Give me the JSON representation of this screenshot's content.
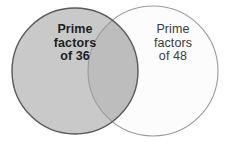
{
  "figure": {
    "type": "venn-diagram",
    "width": 230,
    "height": 147,
    "background_color": "#ffffff"
  },
  "sets": {
    "left": {
      "name": "prime-factors-of-36",
      "lines": [
        "Prime",
        "factors",
        "of 36"
      ],
      "line1": "Prime",
      "line2": "factors",
      "line3": "of 36",
      "fill_color": "#c9c9c9",
      "stroke_color": "#5a5a5a",
      "center_x": 75,
      "center_y": 71,
      "radius": 63
    },
    "right": {
      "name": "prime-factors-of-48",
      "lines": [
        "Prime",
        "factors",
        "of 48"
      ],
      "line1": "Prime",
      "line2": "factors",
      "line3": "of 48",
      "fill_color": "#fcfcfc",
      "stroke_color": "#9a9a9a",
      "center_x": 153,
      "center_y": 71,
      "radius": 65
    },
    "intersection": {
      "name": "common-prime-factors",
      "fill_color": "#bdbdbd",
      "label": ""
    }
  }
}
